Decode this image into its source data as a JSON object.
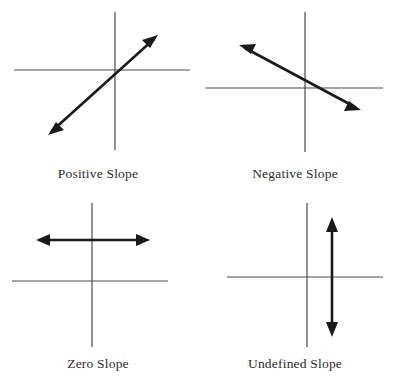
{
  "figure": {
    "background_color": "#ffffff",
    "axis_color": "#4a4a4a",
    "arrow_color": "#1a1a1a",
    "label_color": "#2b2b2b",
    "axis_stroke_width": 1.2,
    "arrow_stroke_width": 2.6
  },
  "panels": [
    {
      "id": "positive",
      "label": "Positive Slope",
      "slope_type": "positive",
      "description": "Line rising from lower-left to upper-right through the origin region",
      "axes": {
        "x_axis_y": 70,
        "y_axis_x": 115,
        "x_from": 14,
        "x_to": 190,
        "y_from": 12,
        "y_to": 150
      },
      "arrow": {
        "kind": "double-headed-line",
        "from": {
          "x": 48,
          "y": 135
        },
        "to": {
          "x": 158,
          "y": 35
        }
      }
    },
    {
      "id": "negative",
      "label": "Negative Slope",
      "slope_type": "negative",
      "description": "Line falling from upper-left to lower-right through the origin region",
      "axes": {
        "x_axis_y": 88,
        "y_axis_x": 108,
        "x_from": 8,
        "x_to": 186,
        "y_from": 12,
        "y_to": 152
      },
      "arrow": {
        "kind": "double-headed-line",
        "from": {
          "x": 42,
          "y": 45
        },
        "to": {
          "x": 164,
          "y": 110
        }
      }
    },
    {
      "id": "zero",
      "label": "Zero Slope",
      "slope_type": "zero",
      "description": "Horizontal line above the x-axis",
      "axes": {
        "x_axis_y": 86,
        "y_axis_x": 92,
        "x_from": 12,
        "x_to": 168,
        "y_from": 8,
        "y_to": 152
      },
      "arrow": {
        "kind": "double-headed-line",
        "from": {
          "x": 36,
          "y": 45
        },
        "to": {
          "x": 150,
          "y": 45
        }
      }
    },
    {
      "id": "undefined",
      "label": "Undefined Slope",
      "slope_type": "undefined",
      "description": "Vertical line to the right of the y-axis",
      "axes": {
        "x_axis_y": 82,
        "y_axis_x": 110,
        "x_from": 30,
        "x_to": 186,
        "y_from": 8,
        "y_to": 152
      },
      "arrow": {
        "kind": "double-headed-line",
        "from": {
          "x": 135,
          "y": 22
        },
        "to": {
          "x": 135,
          "y": 142
        }
      }
    }
  ]
}
